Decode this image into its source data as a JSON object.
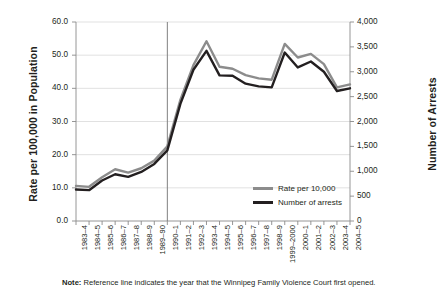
{
  "chart_data": {
    "type": "line",
    "title": "",
    "xlabel": "",
    "ylabel": "Rate per 100,000 in Population",
    "ylabel_right": "Number of Arrests",
    "grid": true,
    "legend_position": "inside-bottom-right",
    "ylim": [
      0,
      60
    ],
    "yticks": [
      "0.0",
      "10.0",
      "20.0",
      "30.0",
      "40.0",
      "50.0",
      "60.0"
    ],
    "ylim_right": [
      0,
      4000
    ],
    "yticks_right": [
      "0",
      "500",
      "1,000",
      "1,500",
      "2,000",
      "2,500",
      "3,000",
      "3,500",
      "4,000"
    ],
    "categories": [
      "1983–4",
      "1984–5",
      "1985–6",
      "1986–7",
      "1987–8",
      "1988–9",
      "1989–90",
      "1990–1",
      "1991–2",
      "1992–3",
      "1993–4",
      "1994–5",
      "1995–6",
      "1996–7",
      "1997–8",
      "1998–9",
      "1999–2000",
      "2000–1",
      "2001–2",
      "2002–3",
      "2003–4",
      "2004–5"
    ],
    "series": [
      {
        "name": "Rate per 10,000",
        "color": "#8c8c8c",
        "axis": "left",
        "values": [
          10.6,
          10.3,
          13.2,
          15.6,
          14.6,
          15.9,
          18.2,
          22.5,
          36.5,
          47.0,
          54.2,
          46.5,
          45.9,
          44.0,
          43.0,
          42.6,
          53.4,
          49.3,
          50.4,
          47.3,
          40.3,
          41.2
        ]
      },
      {
        "name": "Number of arrests",
        "color": "#231f20",
        "axis": "left",
        "values": [
          9.5,
          9.3,
          12.2,
          14.1,
          13.3,
          14.8,
          17.2,
          21.3,
          35.3,
          45.6,
          51.3,
          43.9,
          43.8,
          41.4,
          40.6,
          40.3,
          50.8,
          46.3,
          48.1,
          45.0,
          39.2,
          40.0
        ]
      }
    ],
    "reference_line": {
      "category": "1990–1",
      "color": "#808080"
    },
    "note_prefix": "Note:",
    "note_text": " Reference line indicates the year that the Winnipeg Family Violence Court first opened."
  }
}
